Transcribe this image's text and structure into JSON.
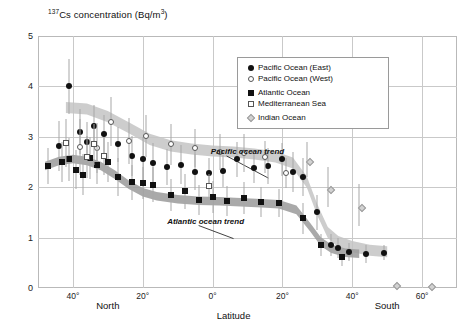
{
  "chart_data": {
    "type": "scatter",
    "title": "137Cs concentration (Bq/m3)",
    "title_prefix": "137",
    "title_main": "Cs concentration (Bq/m",
    "title_sup": "3",
    "title_suffix": ")",
    "xlabel": "Latitude",
    "ylabel": "137Cs concentration (Bq/m3)",
    "xlim": [
      50,
      -70
    ],
    "ylim": [
      0,
      5
    ],
    "grid": true,
    "legend_position": "top-right",
    "yticks": [
      "5",
      "4",
      "3",
      "2",
      "1",
      "0"
    ],
    "ytick_values": [
      5,
      4,
      3,
      2,
      1,
      0
    ],
    "xticks": [
      {
        "label": "40°",
        "value": 40
      },
      {
        "label": "20°",
        "value": 20
      },
      {
        "label": "0°",
        "value": 0
      },
      {
        "label": "20°",
        "value": -20
      },
      {
        "label": "40°",
        "value": -40
      },
      {
        "label": "60°",
        "value": -60
      }
    ],
    "hemisphere_labels": [
      {
        "label": "North",
        "value": 30
      },
      {
        "label": "South",
        "value": -50
      }
    ],
    "annotations": [
      {
        "label": "Pacific ocean trend",
        "x": -10,
        "y": 2.72
      },
      {
        "label": "Atlantic ocean trend",
        "x": 2,
        "y": 1.32
      }
    ],
    "legend": [
      {
        "label": "Pacific Ocean (East)",
        "marker": "filled-circle"
      },
      {
        "label": "Pacific Ocean (West)",
        "marker": "open-circle"
      },
      {
        "label": "Atlantic Ocean",
        "marker": "filled-square"
      },
      {
        "label": "Mediterranean Sea",
        "marker": "open-square"
      },
      {
        "label": "Indian Ocean",
        "marker": "diamond"
      }
    ],
    "series": [
      {
        "name": "Pacific Ocean (East)",
        "marker": "filled-circle",
        "points": [
          {
            "x": 44,
            "y": 2.82,
            "err": 0.5
          },
          {
            "x": 41,
            "y": 4.0,
            "err": 0.55
          },
          {
            "x": 38,
            "y": 3.1,
            "err": 0.45
          },
          {
            "x": 36,
            "y": 2.9,
            "err": 0.4
          },
          {
            "x": 34,
            "y": 3.22,
            "err": 0.42
          },
          {
            "x": 31,
            "y": 3.05,
            "err": 0.38
          },
          {
            "x": 27,
            "y": 2.85,
            "err": 0.35
          },
          {
            "x": 23,
            "y": 2.62,
            "err": 0.4
          },
          {
            "x": 20,
            "y": 2.55,
            "err": 0.45
          },
          {
            "x": 17,
            "y": 2.48,
            "err": 0.4
          },
          {
            "x": 13,
            "y": 2.4,
            "err": 0.35
          },
          {
            "x": 9,
            "y": 2.45,
            "err": 0.38
          },
          {
            "x": 5,
            "y": 2.3,
            "err": 0.35
          },
          {
            "x": 1,
            "y": 2.28,
            "err": 0.3
          },
          {
            "x": -3,
            "y": 2.32,
            "err": 0.32
          },
          {
            "x": -7,
            "y": 2.55,
            "err": 0.35
          },
          {
            "x": -12,
            "y": 2.38,
            "err": 0.3
          },
          {
            "x": -16,
            "y": 2.42,
            "err": 0.35
          },
          {
            "x": -20,
            "y": 2.55,
            "err": 0.32
          },
          {
            "x": -23,
            "y": 2.3,
            "err": 0.4
          },
          {
            "x": -26,
            "y": 2.2,
            "err": 0.38
          },
          {
            "x": -30,
            "y": 1.5,
            "err": 0.35
          },
          {
            "x": -34,
            "y": 0.85,
            "err": 0.22
          },
          {
            "x": -36,
            "y": 0.8,
            "err": 0.2
          },
          {
            "x": -39,
            "y": 0.72,
            "err": 0.18
          },
          {
            "x": -44,
            "y": 0.68,
            "err": 0.18
          },
          {
            "x": -49,
            "y": 0.7,
            "err": 0.15
          }
        ]
      },
      {
        "name": "Pacific Ocean (West)",
        "marker": "open-circle",
        "points": [
          {
            "x": 38,
            "y": 2.8,
            "err": 0.55
          },
          {
            "x": 33,
            "y": 2.78,
            "err": 0.5
          },
          {
            "x": 29,
            "y": 3.3,
            "err": 0.48
          },
          {
            "x": 24,
            "y": 2.92,
            "err": 0.45
          },
          {
            "x": 19,
            "y": 3.02,
            "err": 0.42
          },
          {
            "x": 12,
            "y": 2.85,
            "err": 0.4
          },
          {
            "x": 5,
            "y": 2.78,
            "err": 0.38
          },
          {
            "x": -2,
            "y": 2.7,
            "err": 0.35
          },
          {
            "x": -9,
            "y": 2.68,
            "err": 0.38
          },
          {
            "x": -15,
            "y": 2.6,
            "err": 0.32
          },
          {
            "x": -21,
            "y": 2.28,
            "err": 0.3
          }
        ]
      },
      {
        "name": "Atlantic Ocean",
        "marker": "filled-square",
        "points": [
          {
            "x": 47,
            "y": 2.42,
            "err": 0.35
          },
          {
            "x": 43,
            "y": 2.5,
            "err": 0.4
          },
          {
            "x": 41,
            "y": 2.55,
            "err": 0.42
          },
          {
            "x": 39,
            "y": 2.35,
            "err": 0.38
          },
          {
            "x": 37,
            "y": 2.25,
            "err": 0.4
          },
          {
            "x": 35,
            "y": 2.58,
            "err": 0.42
          },
          {
            "x": 33,
            "y": 2.45,
            "err": 0.38
          },
          {
            "x": 30,
            "y": 2.5,
            "err": 0.4
          },
          {
            "x": 27,
            "y": 2.2,
            "err": 0.38
          },
          {
            "x": 23,
            "y": 2.1,
            "err": 0.35
          },
          {
            "x": 20,
            "y": 2.08,
            "err": 0.32
          },
          {
            "x": 17,
            "y": 2.05,
            "err": 0.35
          },
          {
            "x": 12,
            "y": 1.85,
            "err": 0.32
          },
          {
            "x": 8,
            "y": 1.92,
            "err": 0.35
          },
          {
            "x": 4,
            "y": 1.75,
            "err": 0.3
          },
          {
            "x": 0,
            "y": 1.8,
            "err": 0.32
          },
          {
            "x": -4,
            "y": 1.72,
            "err": 0.3
          },
          {
            "x": -9,
            "y": 1.78,
            "err": 0.32
          },
          {
            "x": -14,
            "y": 1.7,
            "err": 0.3
          },
          {
            "x": -19,
            "y": 1.68,
            "err": 0.28
          },
          {
            "x": -26,
            "y": 1.38,
            "err": 0.3
          },
          {
            "x": -31,
            "y": 0.85,
            "err": 0.22
          },
          {
            "x": -37,
            "y": 0.62,
            "err": 0.18
          }
        ]
      },
      {
        "name": "Mediterranean Sea",
        "marker": "open-square",
        "points": [
          {
            "x": 42,
            "y": 2.88,
            "err": 0.48
          },
          {
            "x": 36,
            "y": 2.6,
            "err": 0.42
          },
          {
            "x": 34,
            "y": 2.85,
            "err": 0.4
          },
          {
            "x": 31,
            "y": 2.62,
            "err": 0.38
          },
          {
            "x": 1,
            "y": 2.02,
            "err": 0.25
          }
        ]
      },
      {
        "name": "Indian Ocean",
        "marker": "diamond",
        "points": [
          {
            "x": -27,
            "y": 2.55,
            "err": 0.35
          },
          {
            "x": -33,
            "y": 2.0,
            "err": 0.4
          },
          {
            "x": -42,
            "y": 1.65,
            "err": 0.42
          },
          {
            "x": -52,
            "y": 0.1,
            "err": 0.0
          },
          {
            "x": -62,
            "y": 0.08,
            "err": 0.0
          }
        ]
      }
    ],
    "trend_bands": [
      {
        "name": "Pacific ocean trend",
        "color": "#c4c4c4",
        "points": [
          [
            42,
            3.58
          ],
          [
            36,
            3.55
          ],
          [
            30,
            3.4
          ],
          [
            24,
            3.18
          ],
          [
            18,
            2.95
          ],
          [
            12,
            2.82
          ],
          [
            6,
            2.76
          ],
          [
            0,
            2.72
          ],
          [
            -6,
            2.7
          ],
          [
            -12,
            2.66
          ],
          [
            -18,
            2.6
          ],
          [
            -23,
            2.48
          ],
          [
            -27,
            2.1
          ],
          [
            -30,
            1.55
          ],
          [
            -33,
            1.1
          ],
          [
            -36,
            0.92
          ],
          [
            -40,
            0.82
          ],
          [
            -45,
            0.75
          ],
          [
            -50,
            0.72
          ]
        ],
        "width": 0.22
      },
      {
        "name": "Atlantic ocean trend",
        "color": "#9a9a9a",
        "points": [
          [
            48,
            2.42
          ],
          [
            44,
            2.52
          ],
          [
            40,
            2.56
          ],
          [
            36,
            2.52
          ],
          [
            32,
            2.42
          ],
          [
            28,
            2.25
          ],
          [
            24,
            2.05
          ],
          [
            20,
            1.9
          ],
          [
            16,
            1.82
          ],
          [
            10,
            1.76
          ],
          [
            4,
            1.73
          ],
          [
            -2,
            1.72
          ],
          [
            -8,
            1.7
          ],
          [
            -14,
            1.68
          ],
          [
            -19,
            1.66
          ],
          [
            -24,
            1.55
          ],
          [
            -28,
            1.2
          ],
          [
            -31,
            0.92
          ],
          [
            -34,
            0.78
          ],
          [
            -38,
            0.7
          ],
          [
            -42,
            0.68
          ]
        ],
        "width": 0.17
      }
    ]
  }
}
